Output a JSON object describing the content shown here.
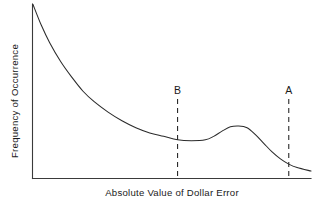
{
  "chart_data": {
    "type": "line",
    "title": "",
    "subtitle": "",
    "xlabel": "Absolute Value of Dollar Error",
    "ylabel": "Frequency of Occurrence",
    "grid": false,
    "legend": null,
    "axis_ticks": {
      "x": [],
      "y": []
    },
    "xlim": [
      0,
      100
    ],
    "ylim": [
      0,
      100
    ],
    "series": [
      {
        "name": "Frequency distribution",
        "description": "Bimodal decaying distribution: steep decline from a high near zero error, a local minimum at marker B, a secondary local maximum (bump), then a decay toward the axis past marker A",
        "x": [
          0,
          3,
          6,
          10,
          14,
          18,
          22,
          27,
          32,
          37,
          42,
          47,
          52,
          57,
          62,
          65,
          68,
          71,
          74,
          77,
          80,
          83,
          86,
          89,
          92,
          95,
          100
        ],
        "y": [
          100,
          88,
          78,
          67,
          58,
          50,
          44,
          38,
          33,
          29,
          26,
          24,
          22,
          21.5,
          22,
          24,
          27,
          29.5,
          30,
          29,
          25,
          20,
          15,
          11,
          8,
          6,
          4
        ]
      }
    ],
    "annotations": [
      {
        "label": "B",
        "type": "vertical-dashed-line",
        "x": 52,
        "note": "marker at local minimum of the curve"
      },
      {
        "label": "A",
        "type": "vertical-dashed-line",
        "x": 92,
        "note": "marker in the far right decaying tail of the curve"
      }
    ],
    "colors": {
      "curve": "#2b2b2b",
      "axis": "#3a3a3a",
      "marker": "#2b2b2b",
      "background": "#ffffff",
      "text": "#1a1a1a"
    }
  }
}
